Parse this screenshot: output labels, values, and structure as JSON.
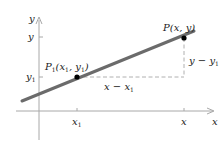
{
  "diagram": {
    "axes": {
      "x_label": "x",
      "y_label": "y",
      "color": "#9a9a9a"
    },
    "ticks": {
      "x1": {
        "base": "x",
        "sub": "1"
      },
      "x": {
        "base": "x"
      },
      "y": {
        "base": "y"
      },
      "y1": {
        "base": "y",
        "sub": "1"
      }
    },
    "points": {
      "p1": {
        "label_main": "P",
        "label_sub": "1",
        "label_args": "(x",
        "label_args_sub": "1",
        "label_mid": ", y",
        "label_mid_sub": "1",
        "label_close": ")"
      },
      "p": {
        "label": "P(x, y)"
      }
    },
    "annotations": {
      "rise": {
        "base": "y − y",
        "sub": "1"
      },
      "run": {
        "base": "x − x",
        "sub": "1"
      }
    },
    "colors": {
      "line": "#6b6b6b",
      "dashed": "#b0b0b0",
      "point": "#000000",
      "text": "#222222"
    }
  }
}
